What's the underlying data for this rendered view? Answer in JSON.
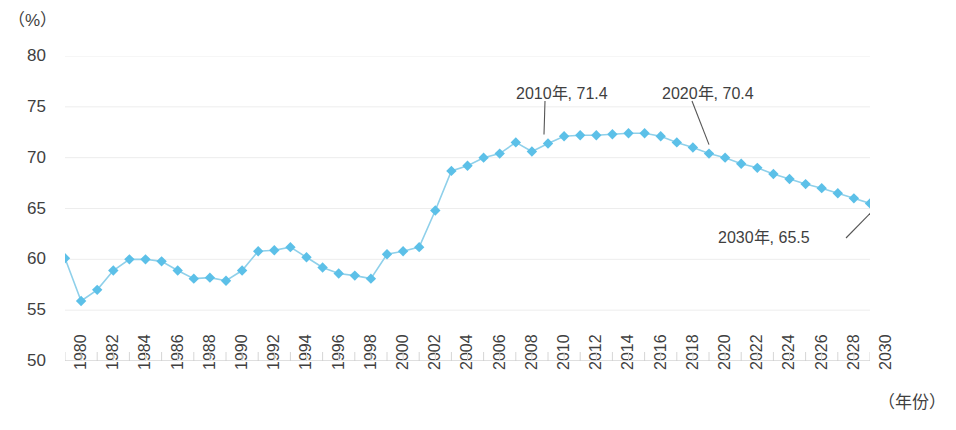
{
  "chart_data": {
    "type": "line",
    "title": "",
    "subtitle": "",
    "xlabel": "（年份）",
    "ylabel": "（%）",
    "ylim": [
      50,
      80
    ],
    "xlim": [
      1980,
      2030
    ],
    "yticks": [
      50,
      55,
      60,
      65,
      70,
      75,
      80
    ],
    "ytick_labels": [
      "50",
      "55",
      "60",
      "65",
      "70",
      "75",
      "80"
    ],
    "xticks": [
      1980,
      1982,
      1984,
      1986,
      1988,
      1990,
      1992,
      1994,
      1996,
      1998,
      2000,
      2002,
      2004,
      2006,
      2008,
      2010,
      2012,
      2014,
      2016,
      2018,
      2020,
      2022,
      2024,
      2026,
      2028,
      2030
    ],
    "xtick_labels": [
      "1980",
      "1982",
      "1984",
      "1986",
      "1988",
      "1990",
      "1992",
      "1994",
      "1996",
      "1998",
      "2000",
      "2002",
      "2004",
      "2006",
      "2008",
      "2010",
      "2012",
      "2014",
      "2016",
      "2018",
      "2020",
      "2022",
      "2024",
      "2026",
      "2028",
      "2030"
    ],
    "grid": true,
    "grid_axis": "y",
    "legend": false,
    "marker": "diamond",
    "series_color": "#5cc0e8",
    "line_color": "#8fd0ea",
    "x": [
      1980,
      1981,
      1982,
      1983,
      1984,
      1985,
      1986,
      1987,
      1988,
      1989,
      1990,
      1991,
      1992,
      1993,
      1994,
      1995,
      1996,
      1997,
      1998,
      1999,
      2000,
      2001,
      2002,
      2003,
      2004,
      2005,
      2006,
      2007,
      2008,
      2009,
      2010,
      2011,
      2012,
      2013,
      2014,
      2015,
      2016,
      2017,
      2018,
      2019,
      2020,
      2021,
      2022,
      2023,
      2024,
      2025,
      2026,
      2027,
      2028,
      2029,
      2030
    ],
    "values": [
      60.1,
      55.9,
      57.0,
      58.9,
      60.0,
      60.0,
      59.8,
      58.9,
      58.1,
      58.2,
      57.9,
      58.9,
      60.8,
      60.9,
      61.2,
      60.2,
      59.2,
      58.6,
      58.4,
      58.1,
      60.5,
      60.8,
      61.2,
      64.8,
      68.7,
      69.2,
      70.0,
      70.4,
      71.5,
      70.6,
      71.4,
      72.1,
      72.2,
      72.2,
      72.3,
      72.4,
      72.4,
      72.1,
      71.5,
      71.0,
      70.4,
      70.0,
      69.4,
      69.0,
      68.4,
      67.9,
      67.4,
      67.0,
      66.5,
      66.0,
      65.5
    ],
    "annotations": [
      {
        "label": "2010年, 71.4",
        "x": 2010,
        "y": 71.4
      },
      {
        "label": "2020年, 70.4",
        "x": 2020,
        "y": 70.4
      },
      {
        "label": "2030年, 65.5",
        "x": 2030,
        "y": 65.5
      }
    ]
  }
}
